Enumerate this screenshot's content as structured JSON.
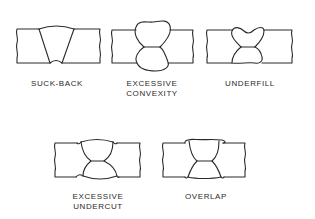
{
  "diagram": {
    "line_color": "#2a2a2a",
    "background": "#ffffff",
    "items": [
      {
        "id": "suck-back",
        "label": "SUCK-BACK"
      },
      {
        "id": "excessive-convexity",
        "label": "EXCESSIVE\nCONVEXITY"
      },
      {
        "id": "underfill",
        "label": "UNDERFILL"
      },
      {
        "id": "excessive-undercut",
        "label": "EXCESSIVE\nUNDERCUT"
      },
      {
        "id": "overlap",
        "label": "OVERLAP"
      }
    ]
  }
}
